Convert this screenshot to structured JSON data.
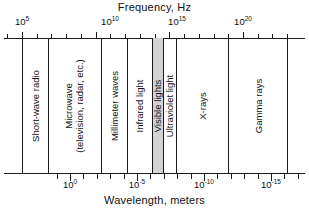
{
  "top_axis": {
    "title": "Frequency, Hz",
    "tick_labels": [
      {
        "base": "10",
        "exp": "5",
        "x": 22
      },
      {
        "base": "10",
        "exp": "10",
        "x": 110
      },
      {
        "base": "10",
        "exp": "15",
        "x": 177
      },
      {
        "base": "10",
        "exp": "20",
        "x": 243
      }
    ]
  },
  "bottom_axis": {
    "title": "Wavelength, meters",
    "tick_labels": [
      {
        "base": "10",
        "exp": "0",
        "x": 70
      },
      {
        "base": "10",
        "exp": "-5",
        "x": 137
      },
      {
        "base": "10",
        "exp": "-10",
        "x": 204
      },
      {
        "base": "10",
        "exp": "-15",
        "x": 271
      }
    ]
  },
  "bands": [
    {
      "name": "short-wave-radio",
      "label": "Short-wave radio",
      "left": 0,
      "width": 26,
      "shaded": false,
      "two_line": false
    },
    {
      "name": "microwave",
      "label": "Microwave\n(television, radar, etc.)",
      "left": 26,
      "width": 53,
      "shaded": false,
      "two_line": true
    },
    {
      "name": "millimeter-waves",
      "label": "Millimeter waves",
      "left": 79,
      "width": 26,
      "shaded": false,
      "two_line": false
    },
    {
      "name": "infrared-light",
      "label": "Infrared light",
      "left": 105,
      "width": 25,
      "shaded": false,
      "two_line": false
    },
    {
      "name": "visible-lights",
      "label": "Visible lights",
      "left": 130,
      "width": 11,
      "shaded": true,
      "two_line": false
    },
    {
      "name": "ultraviolet-light",
      "label": "Ultraviolet light",
      "left": 141,
      "width": 13,
      "shaded": false,
      "two_line": false
    },
    {
      "name": "x-rays",
      "label": "X-rays",
      "left": 154,
      "width": 52,
      "shaded": false,
      "two_line": false
    },
    {
      "name": "gamma-rays",
      "label": "Gamma rays",
      "left": 206,
      "width": 60,
      "shaded": false,
      "two_line": false
    }
  ],
  "chart_data": {
    "type": "bar",
    "orientation": "horizontal-bands",
    "xlabel": "Frequency, Hz",
    "xlabel_secondary": "Wavelength, meters",
    "grid": false,
    "legend": "none",
    "top_axis_scale": "log10",
    "top_axis_ticks": [
      "10^5",
      "10^10",
      "10^15",
      "10^20"
    ],
    "top_axis_minor_tick_count": 24,
    "bottom_axis_scale": "log10",
    "bottom_axis_ticks": [
      "10^0",
      "10^-5",
      "10^-10",
      "10^-15"
    ],
    "bottom_axis_minor_tick_count": 24,
    "categories": [
      "Short-wave radio",
      "Microwave (television, radar, etc.)",
      "Millimeter waves",
      "Infrared light",
      "Visible lights",
      "Ultraviolet light",
      "X-rays",
      "Gamma rays"
    ],
    "bands_frequency_hz": [
      {
        "name": "Short-wave radio",
        "f_min": 100000.0,
        "f_max": 3000000.0
      },
      {
        "name": "Microwave (television, radar, etc.)",
        "f_min": 3000000.0,
        "f_max": 300000000000.0
      },
      {
        "name": "Millimeter waves",
        "f_min": 300000000000.0,
        "f_max": 1000000000000.0
      },
      {
        "name": "Infrared light",
        "f_min": 1000000000000.0,
        "f_max": 400000000000000.0
      },
      {
        "name": "Visible lights",
        "f_min": 400000000000000.0,
        "f_max": 800000000000000.0
      },
      {
        "name": "Ultraviolet light",
        "f_min": 800000000000000.0,
        "f_max": 3e+16
      },
      {
        "name": "X-rays",
        "f_min": 3e+16,
        "f_max": 3e+19
      },
      {
        "name": "Gamma rays",
        "f_min": 3e+19,
        "f_max": 1e+22
      }
    ],
    "shaded_band": "Visible lights",
    "shaded_color": "#d3d3d3"
  }
}
